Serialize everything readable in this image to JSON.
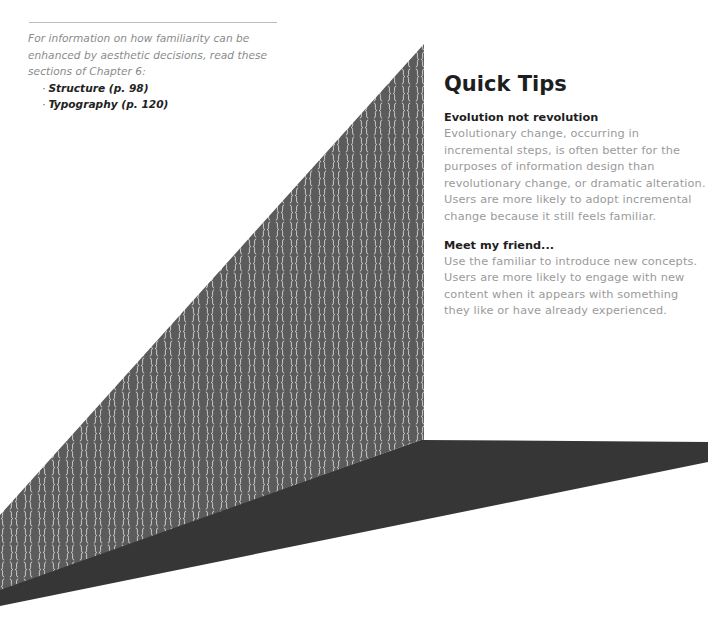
{
  "reference": {
    "intro": "For information on how familiarity can be enhanced by aesthetic decisions, read these sections of Chapter 6:",
    "items": [
      {
        "bullet": "·",
        "label": "Structure (p. 98)"
      },
      {
        "bullet": "·",
        "label": "Typography (p. 120)"
      }
    ]
  },
  "quick_tips": {
    "title": "Quick Tips",
    "tips": [
      {
        "heading": "Evolution not revolution",
        "body": "Evolutionary change, occurring in incremental steps, is often better for the purposes of information design than revolutionary change, or dramatic alteration. Users are more likely to adopt incremental change because it still feels familiar."
      },
      {
        "heading": "Meet my friend...",
        "body": "Use the familiar to introduce new concepts. Users are more likely to engage with new content when it appears with something they like or have already experienced."
      }
    ]
  },
  "graphic": {
    "pattern_glyphs": "{ }",
    "colors": {
      "wall": "#5b5b5b",
      "floor": "#363636",
      "pattern": "#d6d6d6"
    }
  }
}
